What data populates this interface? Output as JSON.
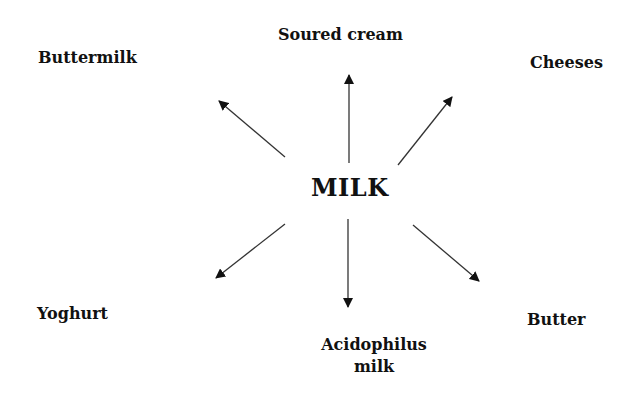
{
  "diagram": {
    "center": {
      "label": "MILK"
    },
    "products": [
      {
        "id": "soured-cream",
        "label": "Soured cream",
        "direction": "up"
      },
      {
        "id": "cheeses",
        "label": "Cheeses",
        "direction": "up-right"
      },
      {
        "id": "butter",
        "label": "Butter",
        "direction": "down-right"
      },
      {
        "id": "acidophilus-milk",
        "label_line1": "Acidophilus",
        "label_line2": "milk",
        "direction": "down"
      },
      {
        "id": "yoghurt",
        "label": "Yoghurt",
        "direction": "down-left"
      },
      {
        "id": "buttermilk",
        "label": "Buttermilk",
        "direction": "up-left"
      }
    ],
    "colors": {
      "text": "#111111",
      "arrow": "#333333",
      "background": "#ffffff"
    }
  }
}
